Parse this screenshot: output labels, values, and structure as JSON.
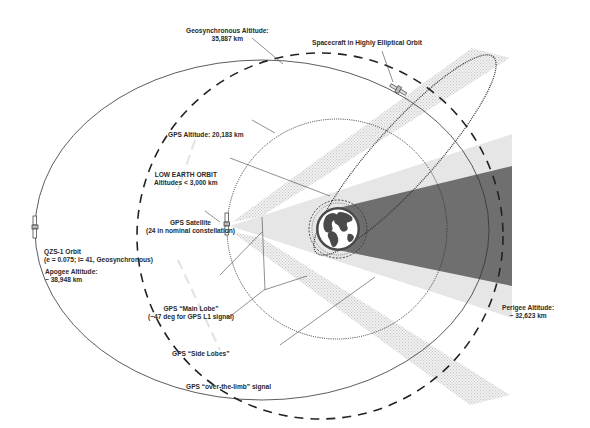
{
  "diagram": {
    "colors": {
      "background": "#ffffff",
      "line": "#333333",
      "main_lobe_shadow": "#6e6e6e",
      "main_lobe_light": "#e4e4e4",
      "side_lobe_hatch": "#d8d8d8",
      "earth_land": "#4a4a4a",
      "earth_ocean": "#ffffff"
    },
    "labels": {
      "geosync_line1": "Geosynchronous Altitude:",
      "geosync_line2": "35,887 km",
      "heo": "Spacecraft in Highly Elliptical Orbit",
      "gps_altitude": "GPS Altitude: 20,183 km",
      "leo_line1": "LOW EARTH ORBIT",
      "leo_line2": "Altitudes < 3,000 km",
      "gps_sat_line1": "GPS Satellite",
      "gps_sat_line2": "(24 in nominal constellation)",
      "qzs_line1": "QZS-1 Orbit",
      "qzs_line2": "(e = 0.075; i= 41, Geosynchronous)",
      "apogee_line1": "Apogee Altitude:",
      "apogee_line2": "~ 38,948 km",
      "main_lobe_line1": "GPS “Main Lobe”",
      "main_lobe_line2": "(~47 deg for GPS L1 signal)",
      "side_lobes": "GPS “Side Lobes”",
      "over_limb": "GPS “over-the-limb” signal",
      "perigee_line1": "Perigee Altitude:",
      "perigee_line2": "~ 32,623 km"
    },
    "orbits": [
      {
        "name": "QZS-1 Orbit",
        "style": "solid",
        "apogee_km": 38948,
        "perigee_km": 32623
      },
      {
        "name": "Geosynchronous",
        "style": "dashed",
        "altitude_km": 35887
      },
      {
        "name": "GPS",
        "style": "dotted",
        "altitude_km": 20183
      },
      {
        "name": "Highly Elliptical Orbit",
        "style": "dotted"
      },
      {
        "name": "Low Earth Orbit",
        "style": "dashed",
        "altitude_km_max": 3000
      }
    ],
    "icons": [
      "earth-icon",
      "gps-satellite-icon",
      "qzs-satellite-icon",
      "heo-satellite-icon"
    ]
  }
}
